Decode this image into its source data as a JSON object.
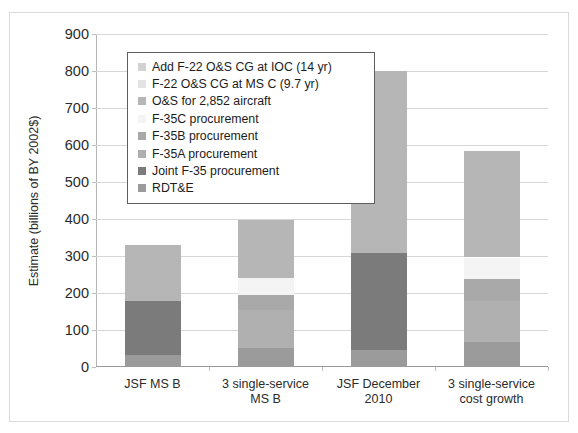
{
  "figure": {
    "cutoff_top_text": "",
    "y_axis_title": "Estimate (billions of BY 2002$)"
  },
  "legend": {
    "position": "upper-left-inside-plot",
    "entries": [
      {
        "label": "Add F-22 O&S CG at IOC (14 yr)",
        "color": "#d2d2d2",
        "key": "f22_cg_ioc"
      },
      {
        "label": "F-22 O&S CG at MS C (9.7 yr)",
        "color": "#e3e3e3",
        "key": "f22_cg_msc"
      },
      {
        "label": "O&S for 2,852 aircraft",
        "color": "#b6b6b6",
        "key": "os_2852"
      },
      {
        "label": "F-35C procurement",
        "color": "#f4f4f4",
        "key": "f35c"
      },
      {
        "label": "F-35B procurement",
        "color": "#a9a9a9",
        "key": "f35b"
      },
      {
        "label": "F-35A procurement",
        "color": "#b0b0b0",
        "key": "f35a"
      },
      {
        "label": "Joint F-35 procurement",
        "color": "#7b7b7b",
        "key": "joint_f35"
      },
      {
        "label": "RDT&E",
        "color": "#9b9b9b",
        "key": "rdte"
      }
    ]
  },
  "chart_data": {
    "type": "bar",
    "stacked": true,
    "title": "",
    "xlabel": "",
    "ylabel": "Estimate (billions of BY 2002$)",
    "ylim": [
      0,
      900
    ],
    "yticks": [
      0,
      100,
      200,
      300,
      400,
      500,
      600,
      700,
      800,
      900
    ],
    "ytick_labels": [
      "0",
      "100",
      "200",
      "300",
      "400",
      "500",
      "600",
      "700",
      "800",
      "900"
    ],
    "grid": true,
    "legend_position": "upper left",
    "categories": [
      "JSF MS B",
      "3 single-service MS B",
      "JSF December 2010",
      "3 single-service cost growth"
    ],
    "category_lines": [
      [
        "JSF MS B"
      ],
      [
        "3 single-service",
        "MS B"
      ],
      [
        "JSF December",
        "2010"
      ],
      [
        "3 single-service",
        "cost growth"
      ]
    ],
    "series": [
      {
        "name": "RDT&E",
        "color": "#9b9b9b",
        "values": [
          32,
          52,
          47,
          67
        ]
      },
      {
        "name": "Joint F-35 procurement",
        "color": "#7b7b7b",
        "values": [
          146,
          0,
          260,
          0
        ]
      },
      {
        "name": "F-35A procurement",
        "color": "#b0b0b0",
        "values": [
          0,
          103,
          0,
          112
        ]
      },
      {
        "name": "F-35B procurement",
        "color": "#a9a9a9",
        "values": [
          0,
          40,
          0,
          60
        ]
      },
      {
        "name": "F-35C procurement",
        "color": "#f4f4f4",
        "values": [
          0,
          45,
          0,
          57
        ]
      },
      {
        "name": "O&S for 2,852 aircraft",
        "color": "#b6b6b6",
        "values": [
          152,
          157,
          493,
          287
        ]
      },
      {
        "name": "F-22 O&S CG at MS C (9.7 yr)",
        "color": "#e3e3e3",
        "values": [
          0,
          0,
          0,
          0
        ]
      },
      {
        "name": "Add F-22 O&S CG at IOC (14 yr)",
        "color": "#d2d2d2",
        "values": [
          0,
          0,
          0,
          0
        ]
      }
    ],
    "totals": [
      330,
      397,
      800,
      583
    ]
  }
}
